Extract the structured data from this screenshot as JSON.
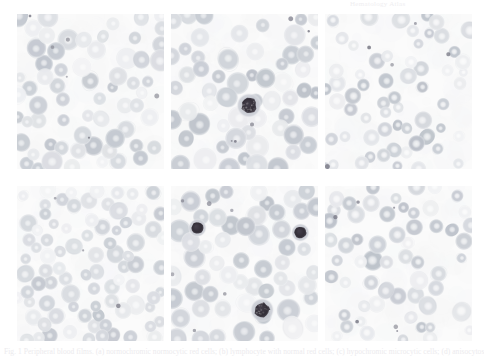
{
  "document": {
    "type": "figure-plate",
    "page_background": "#ffffff",
    "header_text": "Hematology Atlas",
    "caption_text": "Fig. 1  Peripheral blood films. (a) normochromic normocytic red cells; (b) lymphocyte with normal red cells; (c) hypochromic microcytic cells; (d) anisocytosis; (e) two nucleated forms and a monocyte; (f) target cells and poikilocytosis.",
    "panel_count": 6,
    "grid": {
      "rows": 2,
      "columns": 3
    }
  },
  "colors": {
    "page": "#ffffff",
    "panel_background": "#fbfbfb",
    "rbc_light": "#d8dbe0",
    "rbc_mid": "#c2c7cf",
    "rbc_dark": "#a9b0bb",
    "rbc_pale_center": "#f0f1f3",
    "nucleus_dark": "#1d1822",
    "cytoplasm": "#b5b9c4",
    "text_faint": "#e4e2e7"
  },
  "panels": [
    {
      "id": "panel-a",
      "position": "row-1-column-1",
      "label": "a",
      "description": "Normochromic normocytic red blood cells, evenly distributed",
      "seed": 11,
      "cell_count": 64,
      "cell_size_min": 11,
      "cell_size_max": 19,
      "tone": 0.82,
      "pallor": 0.28,
      "nuclei": []
    },
    {
      "id": "panel-b",
      "position": "row-1-column-2",
      "label": "b",
      "description": "Red blood cells with a single small lymphocyte near the centre",
      "seed": 27,
      "cell_count": 58,
      "cell_size_min": 13,
      "cell_size_max": 22,
      "tone": 0.88,
      "pallor": 0.22,
      "nuclei": [
        {
          "x": 0.53,
          "y": 0.59,
          "r": 7.5,
          "cytoplasm_r": 13.0,
          "granular": true
        }
      ]
    },
    {
      "id": "panel-c",
      "position": "row-1-column-3",
      "label": "c",
      "description": "Hypochromic microcytic cells with wide central pallor, target forms",
      "seed": 43,
      "cell_count": 60,
      "cell_size_min": 9,
      "cell_size_max": 17,
      "tone": 0.92,
      "pallor": 0.62,
      "nuclei": []
    },
    {
      "id": "panel-d",
      "position": "row-2-column-1",
      "label": "d",
      "description": "Dense field showing anisocytosis, overlapping red cells",
      "seed": 67,
      "cell_count": 86,
      "cell_size_min": 10,
      "cell_size_max": 18,
      "tone": 0.78,
      "pallor": 0.3,
      "nuclei": []
    },
    {
      "id": "panel-e",
      "position": "row-2-column-2",
      "label": "e",
      "description": "Two small dark nucleated forms and one larger granular monocyte",
      "seed": 89,
      "cell_count": 56,
      "cell_size_min": 13,
      "cell_size_max": 22,
      "tone": 0.9,
      "pallor": 0.2,
      "nuclei": [
        {
          "x": 0.18,
          "y": 0.27,
          "r": 6.0,
          "cytoplasm_r": 9.5,
          "granular": false
        },
        {
          "x": 0.88,
          "y": 0.3,
          "r": 6.0,
          "cytoplasm_r": 9.5,
          "granular": false
        },
        {
          "x": 0.62,
          "y": 0.8,
          "r": 7.5,
          "cytoplasm_r": 12.5,
          "granular": true
        }
      ]
    },
    {
      "id": "panel-f",
      "position": "row-2-column-3",
      "label": "f",
      "description": "Target cells and poikilocytosis on a pale background",
      "seed": 103,
      "cell_count": 58,
      "cell_size_min": 10,
      "cell_size_max": 18,
      "tone": 0.9,
      "pallor": 0.55,
      "nuclei": []
    }
  ]
}
